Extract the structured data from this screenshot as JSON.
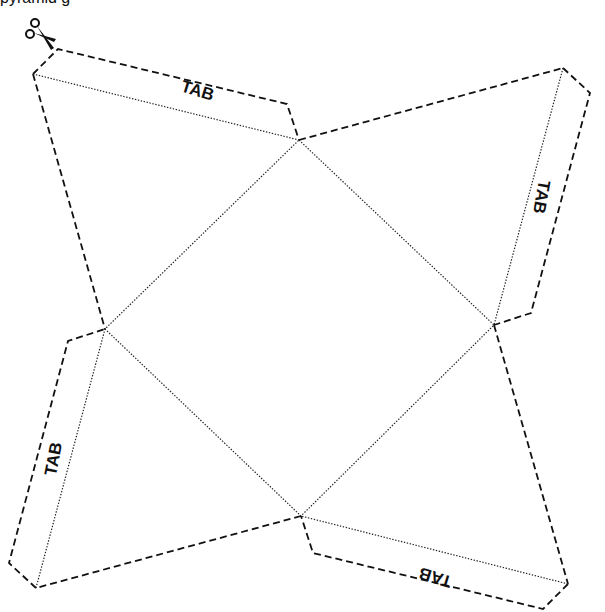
{
  "caption": {
    "text": "pyramid g"
  },
  "template": {
    "name": "square-pyramid-net",
    "icon": "scissors-icon",
    "colors": {
      "line": "#111111",
      "background": "#ffffff"
    },
    "base_square": {
      "top": [
        299,
        140
      ],
      "right": [
        494,
        325
      ],
      "bottom": [
        301,
        516
      ],
      "left": [
        105,
        329
      ]
    },
    "apexes": {
      "top_left": [
        33,
        74
      ],
      "top_right": [
        563,
        68
      ],
      "bottom_right": [
        568,
        584
      ],
      "bottom_left": [
        36,
        588
      ]
    },
    "tabs": [
      {
        "id": "top",
        "label": "TAB",
        "x": 196,
        "y": 96,
        "rotate": 17
      },
      {
        "id": "right",
        "label": "TAB",
        "x": 536,
        "y": 196,
        "rotate": 100
      },
      {
        "id": "bottom",
        "label": "TAB",
        "x": 437,
        "y": 572,
        "rotate": 197
      },
      {
        "id": "left",
        "label": "TAB",
        "x": 59,
        "y": 460,
        "rotate": -79
      }
    ]
  }
}
